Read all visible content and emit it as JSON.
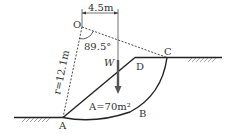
{
  "figure": {
    "type": "slope-stability-diagram",
    "points": {
      "O": {
        "label": "O",
        "x": 82,
        "y": 27
      },
      "A": {
        "label": "A",
        "x": 63,
        "y": 117
      },
      "B": {
        "label": "B"
      },
      "C": {
        "label": "C",
        "x": 167,
        "y": 57
      },
      "D": {
        "label": "D",
        "x": 135,
        "y": 57
      }
    },
    "dimension_label": "4.5m",
    "angle_label": "89.5°",
    "radius_label": "r=12.1m",
    "weight_label": "W",
    "area_label": "A=70m²",
    "colors": {
      "line": "#333333",
      "arrow": "#555555",
      "background": "#ffffff"
    }
  }
}
